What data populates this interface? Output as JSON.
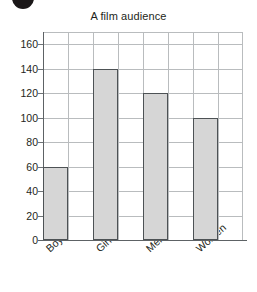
{
  "chart_data": {
    "type": "bar",
    "title": "A film audience",
    "subtitle": "",
    "xlabel": "",
    "ylabel": "",
    "categories": [
      "Boys",
      "Girls",
      "Men",
      "Women"
    ],
    "values": [
      60,
      140,
      120,
      100
    ],
    "ylim": [
      0,
      170
    ],
    "ytick_labels": [
      "0",
      "20",
      "40",
      "60",
      "80",
      "100",
      "120",
      "140",
      "160"
    ],
    "ytick_values": [
      0,
      20,
      40,
      60,
      80,
      100,
      120,
      140,
      160
    ],
    "ytick_interval": 20,
    "grid": "both",
    "legend": "none",
    "bar_fill_color": "#d6d6d6",
    "bar_edge_color": "#4d5255",
    "grid_color": "#b9bcbe",
    "axis_color": "#5d6265",
    "x_label_rotation_deg": -42,
    "columns_across_plot": 8,
    "annotations": []
  },
  "decor": {
    "corner_mark_name": "bullet-dot"
  }
}
